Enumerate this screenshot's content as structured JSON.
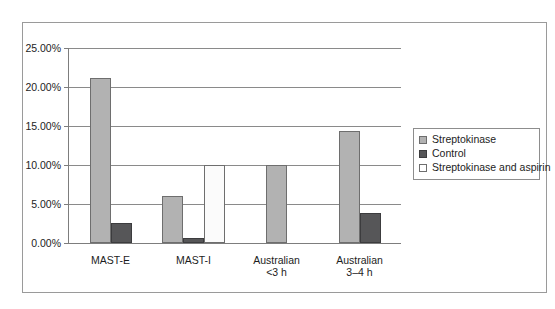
{
  "chart_data": {
    "type": "bar",
    "title": "",
    "subtitle": "",
    "xlabel": "",
    "ylabel": "",
    "ylim": [
      0,
      25
    ],
    "ytick_labels": [
      "0.00%",
      "5.00%",
      "10.00%",
      "15.00%",
      "20.00%",
      "25.00%"
    ],
    "ytick_values": [
      0,
      5,
      10,
      15,
      20,
      25
    ],
    "grid": true,
    "legend_position": "right",
    "categories": [
      "MAST-E",
      "MAST-I",
      "Australian\n<3 h",
      "Australian\n3–4 h"
    ],
    "category_lines": [
      [
        "MAST-E"
      ],
      [
        "MAST-I"
      ],
      [
        "Australian",
        "<3 h"
      ],
      [
        "Australian",
        "3–4 h"
      ]
    ],
    "series": [
      {
        "name": "Streptokinase",
        "color": "#b2b2b2",
        "values": [
          21.2,
          6.0,
          10.0,
          14.4
        ]
      },
      {
        "name": "Control",
        "color": "#565658",
        "values": [
          2.6,
          0.6,
          null,
          3.9
        ]
      },
      {
        "name": "Streptokinase and aspirin",
        "color": "#ffffff",
        "values": [
          null,
          10.0,
          null,
          null
        ]
      }
    ]
  },
  "legend": {
    "items": [
      {
        "label": "Streptokinase",
        "swatch": "legend-swatch-streptokinase"
      },
      {
        "label": "Control",
        "swatch": "legend-swatch-control"
      },
      {
        "label": "Streptokinase and aspirin",
        "swatch": "legend-swatch-streptokinase-and-aspirin"
      }
    ]
  },
  "colors": {
    "streptokinase": "#b2b2b2",
    "control": "#565658",
    "streptokinase_and_aspirin": "#ffffff",
    "frame": "#9a9a9a",
    "axis": "#7d7d7d",
    "gridline": "#8a8a8a",
    "text": "#1d1d1d"
  }
}
